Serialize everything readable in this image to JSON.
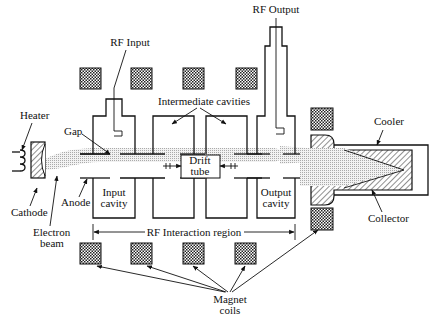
{
  "labels": {
    "rf_input": "RF Input",
    "rf_output": "RF Output",
    "intermediate_cavities": "Intermediate cavities",
    "heater": "Heater",
    "gap": "Gap",
    "cooler": "Cooler",
    "drift_tube_line1": "Drift",
    "drift_tube_line2": "tube",
    "cathode": "Cathode",
    "anode": "Anode",
    "input_cavity_line1": "Input",
    "input_cavity_line2": "cavity",
    "output_cavity_line1": "Output",
    "output_cavity_line2": "cavity",
    "collector": "Collector",
    "electron_beam_line1": "Electron",
    "electron_beam_line2": "beam",
    "rf_interaction_region": "RF Interaction region",
    "magnet_coils_line1": "Magnet",
    "magnet_coils_line2": "coils"
  },
  "colors": {
    "line": "#111111",
    "coil_fill": "#444444",
    "beam_fill": "#d8d8d8",
    "background": "#ffffff"
  }
}
